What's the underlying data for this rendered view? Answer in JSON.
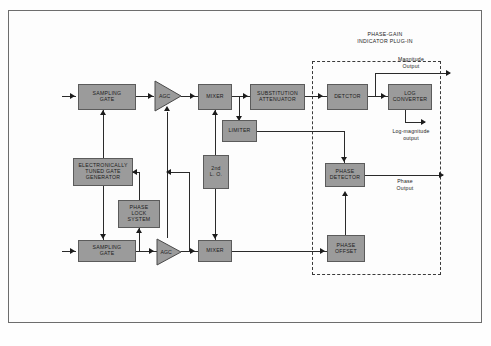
{
  "figure": {
    "plugin_label": "PHASE-GAIN\nINDICATOR  PLUG-IN",
    "plugin_label_line1": "PHASE-GAIN",
    "plugin_label_line2": "INDICATOR  PLUG-IN",
    "frame_color": "#6d6d6d",
    "block_fill": "#9b9b9b",
    "block_stroke": "#5b5b5b",
    "line_color": "#2a2a2a",
    "background": "#fdfdfd"
  },
  "blocks": {
    "sampling_gate_top": "SAMPLING\nGATE",
    "sampling_gate_top_l1": "SAMPLING",
    "sampling_gate_top_l2": "GATE",
    "agc_top": "AGC",
    "mixer_top": "MIXER",
    "substitution_attenuator_l1": "SUBSTITUTION",
    "substitution_attenuator_l2": "ATTENUATOR",
    "detector": "DETCTOR",
    "log_converter_l1": "LOG",
    "log_converter_l2": "CONVERTER",
    "limiter": "LIMITER",
    "second_lo_l1": "2nd",
    "second_lo_l2": "L. O.",
    "etgg_l1": "ELECTRONICALLY",
    "etgg_l2": "TUNED  GATE",
    "etgg_l3": "GENERATOR",
    "phase_lock_l1": "PHASE",
    "phase_lock_l2": "LOCK",
    "phase_lock_l3": "SYSTEM",
    "sampling_gate_bottom_l1": "SAMPLING",
    "sampling_gate_bottom_l2": "GATE",
    "agc_bottom": "AGC",
    "mixer_bottom": "MIXER",
    "phase_detector_l1": "PHASE",
    "phase_detector_l2": "DETECTOR",
    "phase_offset_l1": "PHASE",
    "phase_offset_l2": "OFFSET"
  },
  "outputs": {
    "magnitude_l1": "Magnitude",
    "magnitude_l2": "Output",
    "log_magnitude_l1": "Log-magnitude",
    "log_magnitude_l2": "output",
    "phase_l1": "Phase",
    "phase_l2": "Output"
  }
}
